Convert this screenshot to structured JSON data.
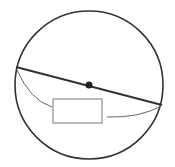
{
  "diagram": {
    "type": "geometry",
    "background": "#ffffff",
    "stroke_color": "#333333",
    "thin_stroke_color": "#666666",
    "circle": {
      "cx": 89,
      "cy": 85,
      "r": 74
    },
    "diameter": {
      "x1": 16,
      "y1": 67,
      "x2": 162,
      "y2": 105
    },
    "center_point": {
      "cx": 89,
      "cy": 85,
      "r": 3.5
    },
    "left_arc": {
      "path": "M17 70 Q30 100 52 107"
    },
    "label_box": {
      "x": 53,
      "y": 99,
      "width": 49,
      "height": 24,
      "text": ""
    },
    "right_arc": {
      "path": "M107 117 Q140 118 161 106"
    }
  }
}
